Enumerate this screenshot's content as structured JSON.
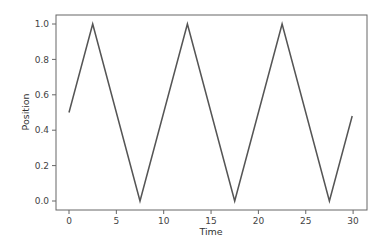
{
  "chart_data": {
    "type": "line",
    "title": "",
    "xlabel": "Time",
    "ylabel": "Position",
    "xlim": [
      -1.5,
      31.5
    ],
    "ylim": [
      -0.05,
      1.05
    ],
    "xticks": [
      0,
      5,
      10,
      15,
      20,
      25,
      30
    ],
    "yticks": [
      0.0,
      0.2,
      0.4,
      0.6,
      0.8,
      1.0
    ],
    "xtick_labels": [
      "0",
      "5",
      "10",
      "15",
      "20",
      "25",
      "30"
    ],
    "ytick_labels": [
      "0.0",
      "0.2",
      "0.4",
      "0.6",
      "0.8",
      "1.0"
    ],
    "grid": false,
    "legend": null,
    "series": [
      {
        "name": "Position",
        "color": "#555555",
        "x": [
          0,
          2.5,
          7.5,
          12.5,
          17.5,
          22.5,
          27.5,
          29.9
        ],
        "y": [
          0.5,
          1.0,
          0.0,
          1.0,
          0.0,
          1.0,
          0.0,
          0.48
        ]
      }
    ]
  }
}
